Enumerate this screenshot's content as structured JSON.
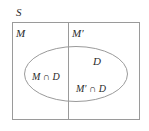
{
  "figure": {
    "type": "venn-diagram",
    "background_color": "#ffffff",
    "line_color": "#9a9a9a",
    "text_color": "#2a2a2a"
  },
  "labels": {
    "universal_set": "S",
    "left_region": "M",
    "right_region": "M′",
    "ellipse": "D",
    "left_intersection": "M ∩ D",
    "right_intersection": "M′ ∩ D"
  },
  "geometry": {
    "rectangle": {
      "x": 12,
      "y": 22,
      "width": 128,
      "height": 98
    },
    "divider_x": 68,
    "ellipse": {
      "cx": 76,
      "cy": 74,
      "rx": 52,
      "ry": 28
    }
  }
}
